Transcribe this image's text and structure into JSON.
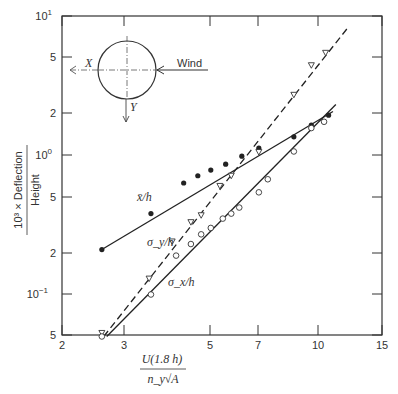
{
  "chart_data": {
    "type": "line",
    "title": "",
    "xlabel": "U(1.8 h) / (n_y √A)",
    "ylabel": "10^3 × Deflection / Height",
    "xscale": "log",
    "yscale": "log",
    "xlim": [
      2,
      15
    ],
    "ylim": [
      0.05,
      10
    ],
    "x_ticks": [
      "2",
      "3",
      "5",
      "7",
      "10",
      "15"
    ],
    "y_ticks": [
      "5",
      "10^-1",
      "2",
      "5",
      "10^0",
      "2",
      "5",
      "10^1"
    ],
    "grid": false,
    "series": [
      {
        "name": "x̄/h",
        "marker": "filled-circle",
        "line": "solid",
        "points": [
          [
            2.57,
            0.21
          ],
          [
            3.5,
            0.38
          ],
          [
            4.3,
            0.63
          ],
          [
            4.7,
            0.71
          ],
          [
            5.1,
            0.78
          ],
          [
            5.6,
            0.86
          ],
          [
            6.2,
            0.98
          ],
          [
            6.9,
            1.12
          ],
          [
            8.6,
            1.35
          ],
          [
            9.6,
            1.64
          ],
          [
            10.7,
            1.93
          ]
        ],
        "fit": [
          [
            2.57,
            0.21
          ],
          [
            11.0,
            2.05
          ]
        ]
      },
      {
        "name": "σ_y/h",
        "marker": "open-triangle",
        "line": "dashed",
        "points": [
          [
            2.57,
            0.053
          ],
          [
            3.46,
            0.13
          ],
          [
            4.0,
            0.24
          ],
          [
            4.5,
            0.33
          ],
          [
            4.8,
            0.37
          ],
          [
            5.4,
            0.6
          ],
          [
            5.8,
            0.71
          ],
          [
            6.9,
            1.05
          ],
          [
            8.6,
            2.7
          ],
          [
            9.6,
            4.4
          ],
          [
            10.5,
            5.4
          ]
        ],
        "fit": [
          [
            2.6,
            0.05
          ],
          [
            12.0,
            8.0
          ]
        ]
      },
      {
        "name": "σ_x/h",
        "marker": "open-circle",
        "line": "solid",
        "points": [
          [
            2.57,
            0.05
          ],
          [
            3.5,
            0.1
          ],
          [
            4.1,
            0.19
          ],
          [
            4.5,
            0.23
          ],
          [
            4.8,
            0.27
          ],
          [
            5.1,
            0.3
          ],
          [
            5.5,
            0.35
          ],
          [
            5.8,
            0.38
          ],
          [
            6.1,
            0.42
          ],
          [
            6.9,
            0.54
          ],
          [
            7.3,
            0.67
          ],
          [
            8.6,
            1.06
          ],
          [
            9.6,
            1.56
          ],
          [
            10.4,
            1.73
          ]
        ],
        "fit": [
          [
            2.65,
            0.05
          ],
          [
            11.2,
            2.3
          ]
        ]
      }
    ],
    "annotations": [
      "x̄/h",
      "σ_y/h",
      "σ_x/h",
      "Wind",
      "X",
      "Y"
    ]
  },
  "labels": {
    "ylabel_num": "10³ × Deflection",
    "ylabel_den": "Height",
    "xlabel_num": "U(1.8 h)",
    "xlabel_den": "n_y√A",
    "mean": "x̄/h",
    "sigy": "σ_y/h",
    "sigx": "σ_x/h",
    "wind": "Wind",
    "xaxis_dir": "X",
    "yaxis_dir": "Y"
  },
  "yticks": [
    {
      "label": "10",
      "sup": "1",
      "y": 16
    },
    {
      "label": "5",
      "sup": "",
      "y": 57
    },
    {
      "label": "2",
      "sup": "",
      "y": 113
    },
    {
      "label": "10",
      "sup": "0",
      "y": 155
    },
    {
      "label": "5",
      "sup": "",
      "y": 197
    },
    {
      "label": "2",
      "sup": "",
      "y": 253
    },
    {
      "label": "10",
      "sup": "−1",
      "y": 294
    },
    {
      "label": "5",
      "sup": "",
      "y": 335
    }
  ],
  "xticks": [
    {
      "label": "2",
      "x": 62
    },
    {
      "label": "3",
      "x": 124
    },
    {
      "label": "5",
      "x": 210
    },
    {
      "label": "7",
      "x": 258
    },
    {
      "label": "10",
      "x": 318
    },
    {
      "label": "15",
      "x": 382
    }
  ]
}
